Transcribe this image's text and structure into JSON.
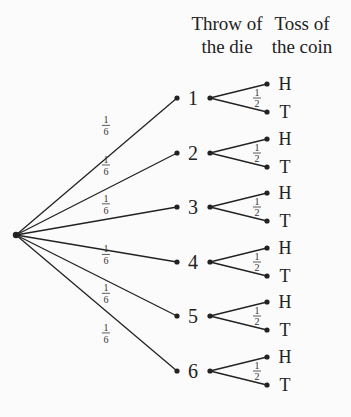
{
  "headers": {
    "die_line1": "Throw of",
    "die_line2": "the die",
    "coin_line1": "Toss of",
    "coin_line2": "the coin"
  },
  "die_probability": {
    "num": "1",
    "den": "6"
  },
  "coin_probability": {
    "num": "1",
    "den": "2"
  },
  "die_outcomes": [
    "1",
    "2",
    "3",
    "4",
    "5",
    "6"
  ],
  "coin_outcomes": [
    "H",
    "T"
  ],
  "colors": {
    "line": "#222222",
    "background": "#fbfbfb"
  }
}
